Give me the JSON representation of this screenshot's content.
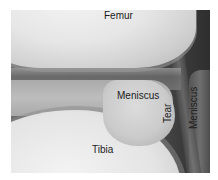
{
  "figure": {
    "labels": {
      "femur": "Femur",
      "meniscus": "Meniscus",
      "tibia": "Tibia",
      "tear": "Tear",
      "meniscus_side": "Meniscus"
    }
  }
}
